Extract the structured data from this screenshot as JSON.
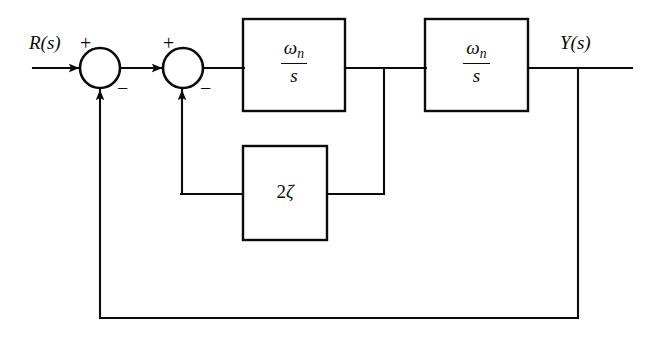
{
  "diagram": {
    "stroke_color": "#0b0b0b",
    "background": "#ffffff",
    "input": {
      "label": "R(s)",
      "name": "input-signal-label"
    },
    "output": {
      "label": "Y(s)",
      "name": "output-signal-label"
    },
    "summers": [
      {
        "id": "summer-1",
        "plus": "+",
        "minus": "−",
        "cx": 100,
        "cy": 68,
        "r": 20
      },
      {
        "id": "summer-2",
        "plus": "+",
        "minus": "−",
        "cx": 183,
        "cy": 68,
        "r": 20
      }
    ],
    "blocks": [
      {
        "id": "block-integrator-1",
        "numerator": "ω",
        "numerator_subscript": "n",
        "denominator": "s",
        "kind": "fraction"
      },
      {
        "id": "block-integrator-2",
        "numerator": "ω",
        "numerator_subscript": "n",
        "denominator": "s",
        "kind": "fraction"
      },
      {
        "id": "block-damping-gain",
        "gain_coefficient": "2",
        "gain_symbol": "ζ",
        "kind": "gain"
      }
    ],
    "loops": [
      {
        "id": "inner-feedback-loop",
        "description": "rate feedback through 2ζ"
      },
      {
        "id": "outer-feedback-loop",
        "description": "unity feedback from output"
      }
    ]
  }
}
